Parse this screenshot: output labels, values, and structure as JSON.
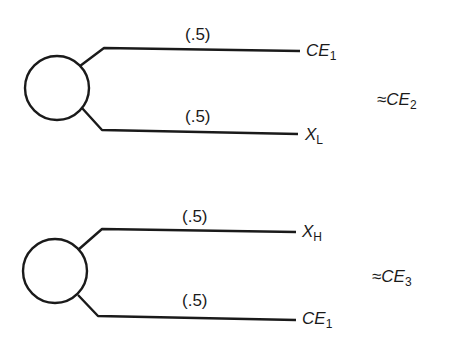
{
  "diagram": {
    "type": "lottery-trees",
    "trees": [
      {
        "id": "tree-1",
        "branches": [
          {
            "probability": "(.5)",
            "outcome_main": "CE",
            "outcome_sub": "1"
          },
          {
            "probability": "(.5)",
            "outcome_main": "X",
            "outcome_sub": "L"
          }
        ],
        "equivalence": {
          "symbol": "≈",
          "main": "CE",
          "sub": "2"
        }
      },
      {
        "id": "tree-2",
        "branches": [
          {
            "probability": "(.5)",
            "outcome_main": "X",
            "outcome_sub": "H"
          },
          {
            "probability": "(.5)",
            "outcome_main": "CE",
            "outcome_sub": "1"
          }
        ],
        "equivalence": {
          "symbol": "≈",
          "main": "CE",
          "sub": "3"
        }
      }
    ],
    "colors": {
      "line": "#1a1a1a",
      "background": "#ffffff"
    }
  }
}
